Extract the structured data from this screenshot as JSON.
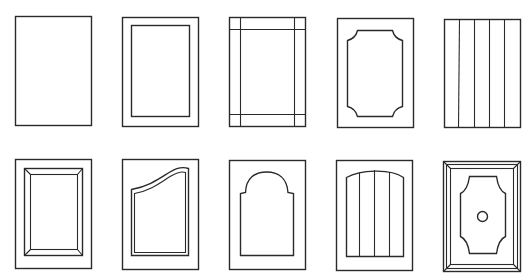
{
  "figure": {
    "stroke_color": "#2a2a2a",
    "background": "#ffffff",
    "rows": [
      {
        "doors": [
          {
            "style": "slab",
            "x": 15,
            "y": 16,
            "w": 76,
            "h": 109
          },
          {
            "style": "shaker-recessed",
            "x": 122,
            "y": 17,
            "w": 76,
            "h": 109
          },
          {
            "style": "five-piece-flat-frame",
            "x": 229,
            "y": 17,
            "w": 76,
            "h": 109
          },
          {
            "style": "shaped-cathedral-corner-panel",
            "x": 337,
            "y": 18,
            "w": 76,
            "h": 109
          },
          {
            "style": "beadboard-vertical-plank",
            "x": 444,
            "y": 19,
            "w": 76,
            "h": 108
          }
        ]
      },
      {
        "doors": [
          {
            "style": "raised-panel-bevel",
            "x": 15,
            "y": 159,
            "w": 76,
            "h": 109
          },
          {
            "style": "curved-top-raised-panel",
            "x": 122,
            "y": 159,
            "w": 76,
            "h": 110
          },
          {
            "style": "arch-top-panel",
            "x": 229,
            "y": 160,
            "w": 76,
            "h": 109
          },
          {
            "style": "arched-plank-panel",
            "x": 336,
            "y": 160,
            "w": 76,
            "h": 110
          },
          {
            "style": "framed-shaped-panel-medallion",
            "x": 443,
            "y": 161,
            "w": 77,
            "h": 110
          }
        ]
      }
    ]
  }
}
